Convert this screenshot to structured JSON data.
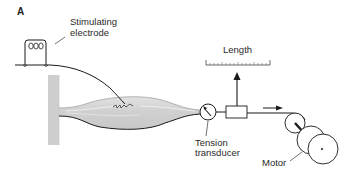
{
  "figure": {
    "panel_label": "A",
    "labels": {
      "electrode_line1": "Stimulating",
      "electrode_line2": "electrode",
      "length": "Length",
      "tension_line1": "Tension",
      "tension_line2": "transducer",
      "motor": "Motor"
    },
    "colors": {
      "line": "#1a1a1a",
      "muscle_fill": "#d4d4d4",
      "wall_fill": "#cfcfcf",
      "text": "#2a2a2a"
    },
    "components": [
      {
        "id": "stimulating-electrode",
        "label": "Stimulating electrode"
      },
      {
        "id": "fixed-wall",
        "label": ""
      },
      {
        "id": "muscle",
        "label": ""
      },
      {
        "id": "tension-transducer",
        "label": "Tension transducer"
      },
      {
        "id": "length-gauge",
        "label": "Length"
      },
      {
        "id": "pulley",
        "label": ""
      },
      {
        "id": "motor",
        "label": "Motor"
      }
    ]
  }
}
